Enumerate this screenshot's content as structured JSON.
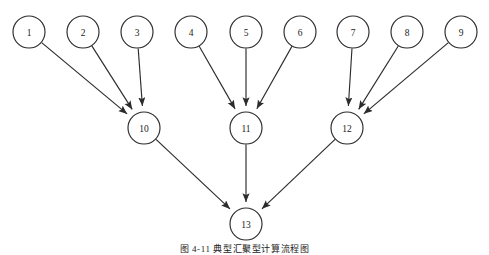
{
  "figure": {
    "caption": "图 4-11  典型汇聚型计算流程图",
    "background_color": "#ffffff",
    "stroke_color": "#2b2b2b",
    "label_color": "#1a1a1a",
    "node_fill_color": "#ffffff"
  },
  "chart_data": {
    "type": "diagram",
    "subtype": "directed-acyclic-graph",
    "title": "图 4-11  典型汇聚型计算流程图",
    "layout": "three-layer convergent tree, arrows point downward",
    "node_radius": 16,
    "layers": [
      {
        "name": "source-layer",
        "y": 32,
        "node_ids": [
          "1",
          "2",
          "3",
          "4",
          "5",
          "6",
          "7",
          "8",
          "9"
        ]
      },
      {
        "name": "intermediate-layer",
        "y": 128,
        "node_ids": [
          "10",
          "11",
          "12"
        ]
      },
      {
        "name": "sink-layer",
        "y": 224,
        "node_ids": [
          "13"
        ]
      }
    ],
    "nodes": [
      {
        "id": "1",
        "label": "1",
        "x": 29,
        "y": 32,
        "layer": 0
      },
      {
        "id": "2",
        "label": "2",
        "x": 83,
        "y": 32,
        "layer": 0
      },
      {
        "id": "3",
        "label": "3",
        "x": 137,
        "y": 32,
        "layer": 0
      },
      {
        "id": "4",
        "label": "4",
        "x": 191,
        "y": 32,
        "layer": 0
      },
      {
        "id": "5",
        "label": "5",
        "x": 246,
        "y": 32,
        "layer": 0
      },
      {
        "id": "6",
        "label": "6",
        "x": 300,
        "y": 32,
        "layer": 0
      },
      {
        "id": "7",
        "label": "7",
        "x": 353,
        "y": 32,
        "layer": 0
      },
      {
        "id": "8",
        "label": "8",
        "x": 407,
        "y": 32,
        "layer": 0
      },
      {
        "id": "9",
        "label": "9",
        "x": 461,
        "y": 32,
        "layer": 0
      },
      {
        "id": "10",
        "label": "10",
        "x": 144,
        "y": 128,
        "layer": 1
      },
      {
        "id": "11",
        "label": "11",
        "x": 246,
        "y": 128,
        "layer": 1
      },
      {
        "id": "12",
        "label": "12",
        "x": 347,
        "y": 128,
        "layer": 1
      },
      {
        "id": "13",
        "label": "13",
        "x": 246,
        "y": 224,
        "layer": 2
      }
    ],
    "edges": [
      {
        "from": "1",
        "to": "10",
        "directed": true
      },
      {
        "from": "2",
        "to": "10",
        "directed": true
      },
      {
        "from": "3",
        "to": "10",
        "directed": true
      },
      {
        "from": "4",
        "to": "11",
        "directed": true
      },
      {
        "from": "5",
        "to": "11",
        "directed": true
      },
      {
        "from": "6",
        "to": "11",
        "directed": true
      },
      {
        "from": "7",
        "to": "12",
        "directed": true
      },
      {
        "from": "8",
        "to": "12",
        "directed": true
      },
      {
        "from": "9",
        "to": "12",
        "directed": true
      },
      {
        "from": "10",
        "to": "13",
        "directed": true
      },
      {
        "from": "11",
        "to": "13",
        "directed": true
      },
      {
        "from": "12",
        "to": "13",
        "directed": true
      }
    ],
    "edge_count": 12,
    "node_count": 13
  }
}
